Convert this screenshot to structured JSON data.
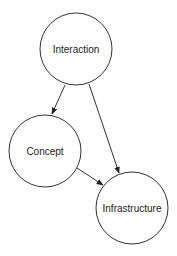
{
  "diagram": {
    "type": "directed-graph",
    "canvas": {
      "width": 177,
      "height": 256,
      "background": "#ffffff"
    },
    "colors": {
      "stroke": "#333333",
      "text": "#222222",
      "fill": "#ffffff"
    },
    "nodes": [
      {
        "id": "interaction",
        "label": "Interaction",
        "cx": 76,
        "cy": 49,
        "r": 36
      },
      {
        "id": "concept",
        "label": "Concept",
        "cx": 45,
        "cy": 151,
        "r": 36
      },
      {
        "id": "infrastructure",
        "label": "Infrastructure",
        "cx": 132,
        "cy": 208,
        "r": 36
      }
    ],
    "edges": [
      {
        "from": "interaction",
        "to": "concept",
        "x1": 65,
        "y1": 85,
        "x2": 52,
        "y2": 114
      },
      {
        "from": "interaction",
        "to": "infrastructure",
        "x1": 89,
        "y1": 84,
        "x2": 119,
        "y2": 173
      },
      {
        "from": "concept",
        "to": "infrastructure",
        "x1": 77,
        "y1": 168,
        "x2": 103,
        "y2": 185
      }
    ]
  }
}
